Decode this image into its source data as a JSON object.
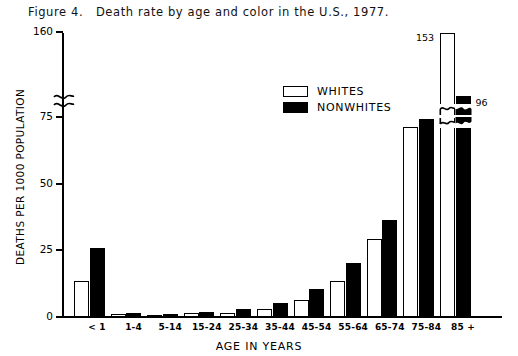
{
  "figure": {
    "title": "Figure 4.   Death rate by age and color in the U.S., 1977."
  },
  "legend": {
    "items": [
      {
        "label": "WHITES",
        "swatch": "white-box-icon"
      },
      {
        "label": "NONWHITES",
        "swatch": "black-box-icon"
      }
    ]
  },
  "axes": {
    "ylabel": "DEATHS PER 1000 POPULATION",
    "xlabel": "AGE IN YEARS",
    "yticks": [
      "0",
      "25",
      "50",
      "75",
      "160"
    ],
    "break_note": "y-axis broken between 75 and 160"
  },
  "chart_data": {
    "type": "bar",
    "title": "Figure 4.   Death rate by age and color in the U.S., 1977.",
    "xlabel": "AGE IN YEARS",
    "ylabel": "DEATHS PER 1000 POPULATION",
    "categories": [
      "< 1",
      "1-4",
      "5-14",
      "15-24",
      "25-34",
      "35-44",
      "45-54",
      "55-64",
      "65-74",
      "75-84",
      "85 +"
    ],
    "series": [
      {
        "name": "WHITES",
        "color": "#ffffff",
        "edge": "#000000",
        "values": [
          13,
          0.7,
          0.4,
          1.1,
          1.3,
          2.7,
          6.0,
          13,
          29,
          71,
          153
        ]
      },
      {
        "name": "NONWHITES",
        "color": "#000000",
        "edge": "#000000",
        "values": [
          25.5,
          1.1,
          0.6,
          1.5,
          2.6,
          5.0,
          10.0,
          20,
          36,
          74,
          96
        ]
      }
    ],
    "ylim": [
      0,
      160
    ],
    "ytick_values": [
      0,
      25,
      50,
      75,
      160
    ],
    "axis_break": {
      "from": 75,
      "to": 160
    },
    "grid": false,
    "legend_position": "upper-center",
    "data_labels": [
      {
        "category": "85 +",
        "series": "WHITES",
        "value": 153,
        "text": "153"
      },
      {
        "category": "85 +",
        "series": "NONWHITES",
        "value": 96,
        "text": "96"
      }
    ]
  }
}
